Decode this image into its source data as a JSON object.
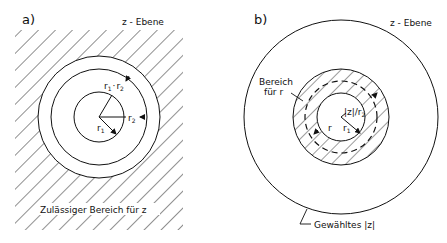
{
  "panel_a": {
    "label": "a)",
    "plane_label": "z - Ebene",
    "region_label": "Zulässiger Bereich für z",
    "radius_labels": {
      "r1": "r",
      "r1_sub": "1",
      "r2": "r",
      "r2_sub": "2",
      "product_r1": "r",
      "product_r1_sub": "1",
      "product_dot": "·",
      "product_r2": "r",
      "product_r2_sub": "2"
    }
  },
  "panel_b": {
    "label": "b)",
    "plane_label": "z - Ebene",
    "range_label_line1": "Bereich",
    "range_label_line2": "für r",
    "inner_label": "|z|/r",
    "inner_label_sub": "2",
    "r_label": "r",
    "r1_label": "r",
    "r1_sub": "1",
    "chosen_label": "Gewähltes |z|"
  }
}
